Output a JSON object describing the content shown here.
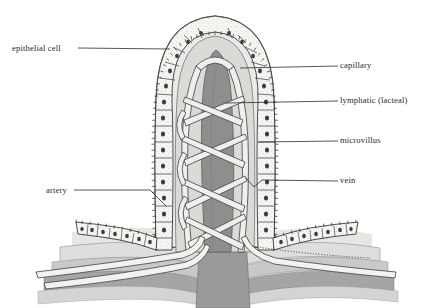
{
  "figure": {
    "background_color": "#ffffff",
    "ink_color": "#2b2b2b"
  },
  "labels": [
    {
      "id": "epithelial-cell",
      "text": "epithelial cell",
      "side": "left",
      "x": 12,
      "y": 44,
      "leader": "horizontal line from text to villus wall"
    },
    {
      "id": "artery",
      "text": "artery",
      "side": "left",
      "x": 46,
      "y": 186,
      "leader": "horizontal line bending down-right into base vessel"
    },
    {
      "id": "capillary",
      "text": "capillary",
      "side": "right",
      "x": 340,
      "y": 61,
      "leader": "horizontal line from text to capillary network"
    },
    {
      "id": "lymphatic",
      "text": "lymphatic (lacteal)",
      "side": "right",
      "x": 340,
      "y": 96,
      "leader": "horizontal line from text to central lacteal"
    },
    {
      "id": "microvillus",
      "text": "microvillus",
      "side": "right",
      "x": 340,
      "y": 136,
      "leader": "horizontal line from text to brush border"
    },
    {
      "id": "vein",
      "text": "vein",
      "side": "right",
      "x": 340,
      "y": 178,
      "leader": "horizontal line with V-bend to vein vessel"
    }
  ],
  "structures": {
    "villus_body": {
      "name": "villus",
      "fill": "#e9e9e6",
      "outline": "#3a3a3a"
    },
    "lamina_propria": {
      "name": "lamina propria core",
      "fill": "#d8d8d4"
    },
    "lacteal": {
      "name": "central lacteal",
      "fill": "#8e8e8c",
      "shape": "tapering vertical column"
    },
    "epithelium": {
      "name": "columnar epithelial cell layer",
      "fill": "#f4f4f1",
      "nucleus_fill": "#3c3c3c",
      "cell_count_per_side": 13
    },
    "brush_border": {
      "name": "microvilli brush border",
      "style": "fine hatched fringe"
    },
    "capillary_network": {
      "name": "capillary loops",
      "stroke": "#4a4a4a",
      "fill": "#efefec"
    },
    "artery_vessel": {
      "name": "artery",
      "fill": "#efefec"
    },
    "vein_vessel": {
      "name": "vein",
      "fill": "#efefec"
    },
    "submucosa_layers": [
      {
        "name": "layer-1-light",
        "fill": "#dedede"
      },
      {
        "name": "layer-2-mid",
        "fill": "#c9c9c9"
      },
      {
        "name": "layer-3-dark",
        "fill": "#9e9e9e"
      },
      {
        "name": "layer-4-pale",
        "fill": "#d4d4d4"
      }
    ],
    "muscularis_column": {
      "name": "central muscular column",
      "fill": "#8e8e8c"
    }
  }
}
